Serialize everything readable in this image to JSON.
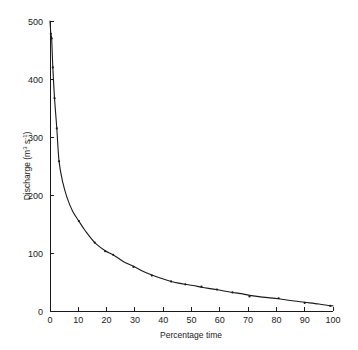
{
  "chart_data": {
    "type": "line",
    "title": "",
    "subtitle": "",
    "xlabel": "Percentage time",
    "ylabel": "Discharge (m3 s-1)",
    "ylabel_parts": {
      "base": "Discharge (m",
      "sup1": "3",
      "mid": " s",
      "sup2": "-1",
      "tail": ")"
    },
    "xlim": [
      0,
      100
    ],
    "ylim": [
      0,
      500
    ],
    "xticks": [
      0,
      10,
      20,
      30,
      40,
      50,
      60,
      70,
      80,
      90,
      100
    ],
    "xtick_labels": [
      "0",
      "10",
      "20",
      "30",
      "40",
      "50",
      "60",
      "70",
      "80",
      "90",
      "100"
    ],
    "yticks": [
      0,
      100,
      200,
      300,
      400,
      500
    ],
    "ytick_labels": [
      "0",
      "100",
      "200",
      "300",
      "400",
      "500"
    ],
    "grid": false,
    "legend": null,
    "series": [
      {
        "name": "Flow duration curve",
        "marker": "dot",
        "color": "#1a1a1a",
        "x": [
          0.3,
          0.6,
          1.0,
          1.6,
          2.4,
          3.2,
          10.2,
          15.8,
          19.5,
          22.3,
          29.5,
          36.0,
          42.8,
          47.8,
          53.5,
          59.0,
          64.5,
          70.5,
          80.8,
          90.0,
          99.0
        ],
        "y": [
          478,
          470,
          420,
          367,
          315,
          258,
          155,
          118,
          103,
          97,
          76,
          61,
          51,
          46,
          42,
          37,
          32,
          25,
          22,
          14,
          9
        ]
      }
    ],
    "curve": {
      "x": [
        0,
        0.3,
        0.6,
        1.0,
        1.6,
        2.4,
        3.2,
        4.5,
        6.0,
        8.0,
        10.2,
        12.5,
        15.8,
        19.5,
        22.3,
        26.0,
        29.5,
        33.0,
        36.0,
        39.5,
        42.8,
        45.5,
        47.8,
        50.5,
        53.5,
        56.0,
        59.0,
        62.0,
        64.5,
        67.5,
        70.5,
        75.0,
        80.8,
        85.0,
        90.0,
        95.0,
        99.0,
        100
      ],
      "y": [
        500,
        478,
        468,
        420,
        367,
        315,
        258,
        222,
        196,
        172,
        155,
        138,
        118,
        104,
        97,
        85,
        77,
        68,
        62,
        56,
        51,
        48,
        46,
        44,
        41,
        39,
        37,
        34,
        32,
        30,
        27,
        24,
        21,
        18,
        15,
        12,
        9,
        9
      ]
    },
    "axis_geometry": {
      "plot_left_px": 50,
      "plot_right_px": 333,
      "plot_top_px": 21,
      "plot_bottom_px": 311
    }
  }
}
